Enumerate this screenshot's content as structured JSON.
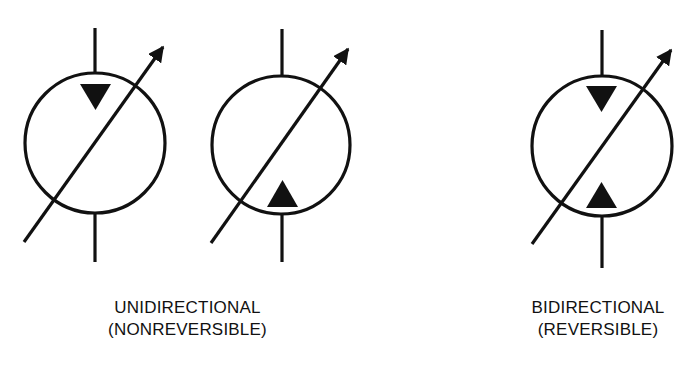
{
  "colors": {
    "ink": "#111111",
    "background": "#ffffff"
  },
  "symbols": [
    {
      "id": "unidirectional-down",
      "type": "variable-displacement-pump",
      "triangles": [
        "top-pointing-down"
      ]
    },
    {
      "id": "unidirectional-up",
      "type": "variable-displacement-pump",
      "triangles": [
        "bottom-pointing-up"
      ]
    },
    {
      "id": "bidirectional",
      "type": "variable-displacement-pump",
      "triangles": [
        "top-pointing-down",
        "bottom-pointing-up"
      ]
    }
  ],
  "captions": {
    "unidirectional": {
      "line1": "UNIDIRECTIONAL",
      "line2": "(NONREVERSIBLE)"
    },
    "bidirectional": {
      "line1": "BIDIRECTIONAL",
      "line2": "(REVERSIBLE)"
    }
  }
}
